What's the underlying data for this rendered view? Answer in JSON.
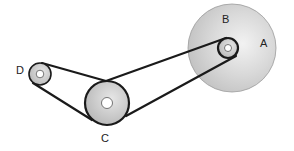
{
  "diagram": {
    "type": "belt-pulley-system",
    "colors": {
      "belt": "#1a1a1a",
      "pulley_fill": "#c8c8c8",
      "pulley_light": "#ededed",
      "hub": "#ffffff",
      "background": "#ffffff"
    },
    "pulleys": [
      {
        "id": "A",
        "label": "A",
        "description": "large wheel"
      },
      {
        "id": "B",
        "label": "B",
        "description": "small pulley on shaft of A"
      },
      {
        "id": "C",
        "label": "C",
        "description": "medium pulley"
      },
      {
        "id": "D",
        "label": "D",
        "description": "small pulley"
      }
    ],
    "belts": [
      {
        "from": "D",
        "to": "C"
      },
      {
        "from": "C",
        "to": "B"
      }
    ]
  }
}
